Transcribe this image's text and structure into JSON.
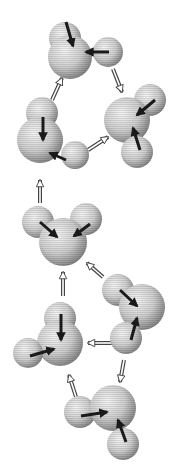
{
  "diagram": {
    "colors": {
      "sphere_light": "#e6e6e6",
      "sphere_dark": "#8a8a8a",
      "arrow": "#1a1a1a",
      "bond_arrow": "#555555",
      "background": "#ffffff"
    },
    "molecules": [
      {
        "id": "m1",
        "spheres": [
          {
            "cx": 65,
            "cy": 38,
            "r": 16
          },
          {
            "cx": 70,
            "cy": 57,
            "r": 22
          },
          {
            "cx": 108,
            "cy": 52,
            "r": 15
          }
        ],
        "arrows": [
          {
            "x1": 66,
            "y1": 22,
            "x2": 73,
            "y2": 46
          },
          {
            "x1": 109,
            "y1": 52,
            "x2": 86,
            "y2": 52
          }
        ]
      },
      {
        "id": "m2",
        "spheres": [
          {
            "cx": 42,
            "cy": 113,
            "r": 16
          },
          {
            "cx": 40,
            "cy": 140,
            "r": 23
          },
          {
            "cx": 75,
            "cy": 155,
            "r": 14
          }
        ],
        "arrows": [
          {
            "x1": 43,
            "y1": 117,
            "x2": 43,
            "y2": 140
          },
          {
            "x1": 66,
            "y1": 160,
            "x2": 50,
            "y2": 153
          }
        ]
      },
      {
        "id": "m3",
        "spheres": [
          {
            "cx": 150,
            "cy": 100,
            "r": 16
          },
          {
            "cx": 127,
            "cy": 120,
            "r": 23
          },
          {
            "cx": 137,
            "cy": 152,
            "r": 16
          }
        ],
        "arrows": [
          {
            "x1": 155,
            "y1": 100,
            "x2": 137,
            "y2": 115
          },
          {
            "x1": 140,
            "y1": 150,
            "x2": 133,
            "y2": 128
          }
        ]
      },
      {
        "id": "m4",
        "spheres": [
          {
            "cx": 38,
            "cy": 222,
            "r": 16
          },
          {
            "cx": 86,
            "cy": 219,
            "r": 16
          },
          {
            "cx": 63,
            "cy": 242,
            "r": 24
          }
        ],
        "arrows": [
          {
            "x1": 40,
            "y1": 222,
            "x2": 57,
            "y2": 237
          },
          {
            "x1": 90,
            "y1": 224,
            "x2": 74,
            "y2": 236
          }
        ]
      },
      {
        "id": "m5",
        "spheres": [
          {
            "cx": 118,
            "cy": 290,
            "r": 16
          },
          {
            "cx": 142,
            "cy": 307,
            "r": 23
          },
          {
            "cx": 126,
            "cy": 338,
            "r": 16
          }
        ],
        "arrows": [
          {
            "x1": 120,
            "y1": 290,
            "x2": 137,
            "y2": 306
          },
          {
            "x1": 131,
            "y1": 340,
            "x2": 137,
            "y2": 318
          }
        ]
      },
      {
        "id": "m6",
        "spheres": [
          {
            "cx": 60,
            "cy": 318,
            "r": 16
          },
          {
            "cx": 60,
            "cy": 343,
            "r": 23
          },
          {
            "cx": 28,
            "cy": 353,
            "r": 15
          }
        ],
        "arrows": [
          {
            "x1": 61,
            "y1": 314,
            "x2": 61,
            "y2": 340
          },
          {
            "x1": 30,
            "y1": 356,
            "x2": 54,
            "y2": 349
          }
        ]
      },
      {
        "id": "m7",
        "spheres": [
          {
            "cx": 80,
            "cy": 412,
            "r": 16
          },
          {
            "cx": 113,
            "cy": 408,
            "r": 23
          },
          {
            "cx": 123,
            "cy": 444,
            "r": 16
          }
        ],
        "arrows": [
          {
            "x1": 81,
            "y1": 416,
            "x2": 107,
            "y2": 412
          },
          {
            "x1": 126,
            "y1": 442,
            "x2": 118,
            "y2": 420
          }
        ]
      }
    ],
    "bond_arrows": [
      {
        "id": "b1",
        "x1": 52,
        "y1": 100,
        "x2": 62,
        "y2": 78
      },
      {
        "id": "b2",
        "x1": 113,
        "y1": 69,
        "x2": 122,
        "y2": 92
      },
      {
        "id": "b3",
        "x1": 88,
        "y1": 150,
        "x2": 108,
        "y2": 137
      },
      {
        "id": "b4",
        "x1": 40,
        "y1": 203,
        "x2": 40,
        "y2": 180
      },
      {
        "id": "b5",
        "x1": 103,
        "y1": 277,
        "x2": 87,
        "y2": 263
      },
      {
        "id": "b6",
        "x1": 63,
        "y1": 296,
        "x2": 63,
        "y2": 272
      },
      {
        "id": "b7",
        "x1": 112,
        "y1": 343,
        "x2": 88,
        "y2": 343
      },
      {
        "id": "b8",
        "x1": 124,
        "y1": 360,
        "x2": 120,
        "y2": 382
      },
      {
        "id": "b9",
        "x1": 76,
        "y1": 397,
        "x2": 69,
        "y2": 375
      }
    ]
  }
}
